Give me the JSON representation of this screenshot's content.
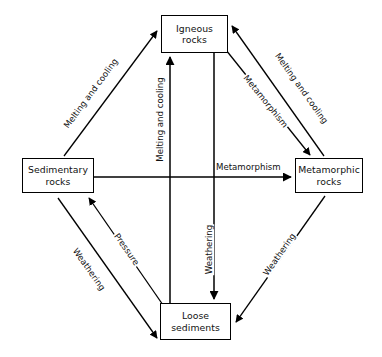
{
  "diagram": {
    "background_color": "#ffffff",
    "line_color": "#000000",
    "text_color": "#111111",
    "nodes": [
      {
        "id": "igneous",
        "line1": "Igneous",
        "line2": "rocks"
      },
      {
        "id": "sedimentary",
        "line1": "Sedimentary",
        "line2": "rocks"
      },
      {
        "id": "metamorphic",
        "line1": "Metamorphic",
        "line2": "rocks"
      },
      {
        "id": "loose",
        "line1": "Loose",
        "line2": "sediments"
      }
    ],
    "edges": [
      {
        "id": "sed-to-ign-diag",
        "label": "Melting and cooling",
        "from": "sedimentary",
        "to": "igneous",
        "direction": "up-right"
      },
      {
        "id": "ign-to-meta-diag",
        "label": "Melting and cooling",
        "from": "metamorphic",
        "to": "igneous",
        "direction": "up-left"
      },
      {
        "id": "ign-to-meta-inner",
        "label": "Metamorphism",
        "from": "igneous",
        "to": "metamorphic",
        "direction": "down-right"
      },
      {
        "id": "loose-to-ign-vert",
        "label": "Melting and cooling",
        "from": "loose",
        "to": "igneous",
        "direction": "up"
      },
      {
        "id": "ign-to-loose-vert",
        "label": "Weathering",
        "from": "igneous",
        "to": "loose",
        "direction": "down"
      },
      {
        "id": "sed-to-meta-horiz",
        "label": "Metamorphism",
        "from": "sedimentary",
        "to": "metamorphic",
        "direction": "right"
      },
      {
        "id": "loose-to-sed-diag",
        "label": "Pressure",
        "from": "loose",
        "to": "sedimentary",
        "direction": "up-left"
      },
      {
        "id": "sed-to-loose-diag",
        "label": "Weathering",
        "from": "sedimentary",
        "to": "loose",
        "direction": "down-right"
      },
      {
        "id": "meta-to-loose-diag",
        "label": "Weathering",
        "from": "metamorphic",
        "to": "loose",
        "direction": "down-left"
      }
    ]
  }
}
